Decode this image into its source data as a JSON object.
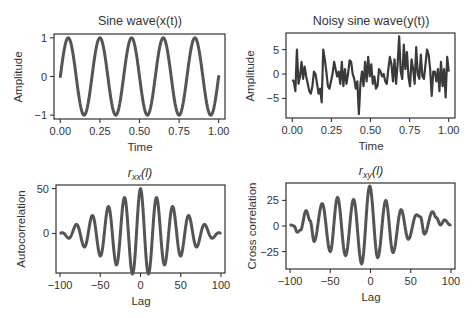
{
  "chart_data": [
    {
      "id": "sine",
      "type": "line",
      "title": "Sine wave(x(t))",
      "title_main": "Sine wave(x(t))",
      "xlabel": "Time",
      "ylabel": "Amplitude",
      "xlim": [
        -0.04,
        1.04
      ],
      "ylim": [
        -1.1,
        1.1
      ],
      "xticks": [
        0.0,
        0.25,
        0.5,
        0.75,
        1.0
      ],
      "xtick_labels": [
        "0.00",
        "0.25",
        "0.50",
        "0.75",
        "1.00"
      ],
      "yticks": [
        -1,
        0,
        1
      ],
      "ytick_labels": [
        "−1",
        "0",
        "1"
      ],
      "function": "sin(2*pi*5*t)",
      "t_range": [
        0,
        1
      ],
      "num_points": 200,
      "series": [
        {
          "name": "x(t)"
        }
      ]
    },
    {
      "id": "noisy",
      "type": "line",
      "title": "Noisy sine wave(y(t))",
      "xlabel": "Time",
      "ylabel": "Amplitude",
      "xlim": [
        -0.04,
        1.04
      ],
      "ylim": [
        -9,
        8.4
      ],
      "xticks": [
        0.0,
        0.25,
        0.5,
        0.75,
        1.0
      ],
      "xtick_labels": [
        "0.00",
        "0.25",
        "0.50",
        "0.75",
        "1.00"
      ],
      "yticks": [
        -5,
        0,
        5
      ],
      "ytick_labels": [
        "−5",
        "0",
        "5"
      ],
      "series": [
        {
          "name": "y(t)",
          "x_start": 0.0,
          "x_end": 1.0,
          "values": [
            -1.2,
            -1.5,
            -3.5,
            5.0,
            -2.0,
            -0.5,
            2.5,
            -1.0,
            1.5,
            -0.5,
            -2.0,
            -3.5,
            -4.0,
            -2.5,
            0.5,
            0.0,
            -2.0,
            -4.0,
            -3.0,
            -5.8,
            5.0,
            3.0,
            0.5,
            -2.5,
            -3.0,
            -1.5,
            0.0,
            2.5,
            1.0,
            -0.5,
            0.5,
            -2.0,
            2.5,
            -2.5,
            1.0,
            -2.0,
            0.0,
            2.8,
            2.5,
            0.0,
            -1.0,
            -3.0,
            -1.5,
            -8.2,
            -2.0,
            0.5,
            -2.5,
            2.5,
            -1.5,
            3.5,
            -0.5,
            2.0,
            -2.0,
            -0.5,
            -3.0,
            -2.5,
            1.0,
            0.5,
            -0.5,
            0.0,
            -1.5,
            -2.0,
            1.0,
            3.5,
            2.0,
            -1.5,
            3.0,
            -2.0,
            2.0,
            7.7,
            0.5,
            -1.0,
            6.0,
            1.0,
            4.5,
            -0.5,
            -2.5,
            3.0,
            1.0,
            -2.0,
            5.5,
            0.0,
            -1.0,
            4.0,
            -0.5,
            -1.0,
            2.0,
            5.0,
            4.0,
            1.0,
            -4.5,
            0.5,
            0.5,
            -1.5,
            1.0,
            -3.5,
            2.5,
            -2.5,
            1.0,
            -4.8,
            3.5,
            0.5
          ]
        }
      ]
    },
    {
      "id": "rxx",
      "type": "line",
      "title": "r_xx(l)",
      "title_parts": {
        "main": "r",
        "sub": "xx",
        "tail": "(l)"
      },
      "xlabel": "Lag",
      "ylabel": "Autocorrelation",
      "xlim": [
        -105,
        105
      ],
      "ylim": [
        -44,
        54
      ],
      "xticks": [
        -100,
        -50,
        0,
        50,
        100
      ],
      "xtick_labels": [
        "−100",
        "−50",
        "0",
        "50",
        "100"
      ],
      "yticks": [
        0,
        50
      ],
      "ytick_labels": [
        "0",
        "50"
      ],
      "function": "50*(1-|l|/100)*cos(2*pi*l/20)",
      "lag_range": [
        -99,
        99
      ],
      "series": [
        {
          "name": "r_xx"
        }
      ]
    },
    {
      "id": "rxy",
      "type": "line",
      "title": "r_xy(l)",
      "title_parts": {
        "main": "r",
        "sub": "xy",
        "tail": "(l)"
      },
      "xlabel": "Lag",
      "ylabel": "Cross correlation",
      "xlim": [
        -105,
        105
      ],
      "ylim": [
        -42,
        42
      ],
      "xticks": [
        -100,
        -50,
        0,
        50,
        100
      ],
      "xtick_labels": [
        "−100",
        "−50",
        "0",
        "50",
        "100"
      ],
      "yticks": [
        -25,
        0,
        25
      ],
      "ytick_labels": [
        "−25",
        "0",
        "25"
      ],
      "series": [
        {
          "name": "r_xy",
          "points": [
            [
              -99,
              1
            ],
            [
              -95,
              0
            ],
            [
              -91,
              -6
            ],
            [
              -87,
              -4
            ],
            [
              -80,
              15
            ],
            [
              -75,
              5
            ],
            [
              -70,
              -15
            ],
            [
              -60,
              22
            ],
            [
              -50,
              -25
            ],
            [
              -41,
              28
            ],
            [
              -31,
              -29
            ],
            [
              -21,
              26
            ],
            [
              -11,
              -37
            ],
            [
              -1,
              39
            ],
            [
              9,
              -31
            ],
            [
              19,
              25
            ],
            [
              28,
              -26
            ],
            [
              38,
              16
            ],
            [
              47,
              -13
            ],
            [
              57,
              11
            ],
            [
              62,
              9
            ],
            [
              67,
              -8
            ],
            [
              77,
              14
            ],
            [
              82,
              8
            ],
            [
              87,
              1
            ],
            [
              92,
              6
            ],
            [
              99,
              1
            ]
          ]
        }
      ]
    }
  ]
}
